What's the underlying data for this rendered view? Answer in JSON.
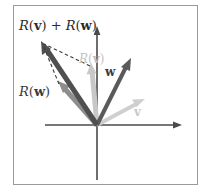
{
  "figure": {
    "background_color": "#ffffff",
    "frame_color": "#9a9a9a",
    "axes": {
      "color": "#4a4a4a",
      "origin": [
        97,
        125
      ],
      "x_axis": {
        "from": [
          45,
          125
        ],
        "to": [
          182,
          125
        ],
        "arrow": "right"
      },
      "y_axis": {
        "from": [
          97,
          180
        ],
        "to": [
          97,
          26
        ],
        "arrow": "up"
      }
    },
    "labels": {
      "sum": "R(v) + R(w)",
      "sum_parts": {
        "r1": "R",
        "open1": "(",
        "v": "v",
        "close1": ")",
        "plus": " + ",
        "r2": "R",
        "open2": "(",
        "w": "w",
        "close2": ")"
      },
      "rw": "R(w)",
      "rw_parts": {
        "r": "R",
        "open": "(",
        "w": "w",
        "close": ")"
      },
      "rv": "R(v)",
      "rv_parts": {
        "r": "R",
        "open": "(",
        "v": "v",
        "close": ")"
      },
      "w": "w",
      "v": "v"
    },
    "vectors": [
      {
        "name": "v",
        "label": "v",
        "color": "#cfcfcf",
        "from": [
          97,
          125
        ],
        "to": [
          144,
          100
        ],
        "width": 4,
        "style": "solid"
      },
      {
        "name": "w",
        "label": "w",
        "color": "#5a5a5a",
        "from": [
          97,
          125
        ],
        "to": [
          130,
          59
        ],
        "width": 4,
        "style": "solid"
      },
      {
        "name": "R(v)",
        "label": "R(v)",
        "color": "#c8c8c8",
        "from": [
          97,
          125
        ],
        "to": [
          91,
          64
        ],
        "width": 5,
        "style": "solid"
      },
      {
        "name": "R(w)",
        "label": "R(w)",
        "color": "#8d8d8d",
        "from": [
          97,
          125
        ],
        "to": [
          59,
          82
        ],
        "width": 5,
        "style": "solid"
      },
      {
        "name": "R(v)+R(w)",
        "label": "R(v) + R(w)",
        "color": "#4f4f4f",
        "from": [
          97,
          125
        ],
        "to": [
          42,
          42
        ],
        "width": 5,
        "style": "solid"
      }
    ],
    "construction_lines": [
      {
        "name": "dashed-rv-to-sum",
        "from": [
          91,
          64
        ],
        "to": [
          42,
          42
        ],
        "color": "#3a3a3a",
        "style": "dashed"
      },
      {
        "name": "dashed-rw-to-sum",
        "from": [
          59,
          82
        ],
        "to": [
          42,
          42
        ],
        "color": "#3a3a3a",
        "style": "dashed"
      }
    ]
  }
}
